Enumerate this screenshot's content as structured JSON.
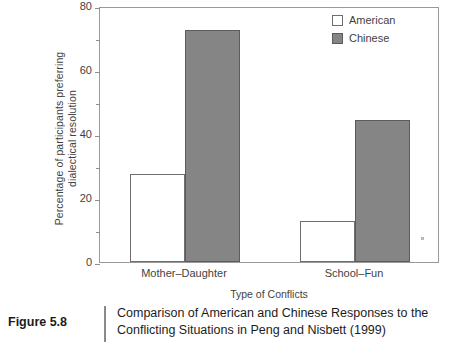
{
  "figure": {
    "number_label": "Figure 5.8",
    "caption_line1": "Comparison of American and Chinese Responses to the",
    "caption_line2": "Conflicting Situations in Peng and Nisbett (1999)"
  },
  "legend": {
    "position": "top-right",
    "entries": [
      {
        "label": "American",
        "swatch": "white-square",
        "color": "#ffffff"
      },
      {
        "label": "Chinese",
        "swatch": "gray-square",
        "color": "#858585"
      }
    ]
  },
  "axes": {
    "y_title_line1": "Percentage of participants preferring",
    "y_title_line2": "dialectical resolution",
    "x_title": "Type of Conflicts",
    "y_ticks": [
      "0",
      "20",
      "40",
      "60",
      "80"
    ],
    "y_minor_ticks": [
      "10",
      "30",
      "50",
      "70"
    ]
  },
  "chart_data": {
    "type": "bar",
    "title": "Comparison of American and Chinese Responses to the Conflicting Situations in Peng and Nisbett (1999)",
    "categories": [
      "Mother–Daughter",
      "School–Fun"
    ],
    "series": [
      {
        "name": "American",
        "values": [
          27.5,
          12.8
        ],
        "color": "#ffffff"
      },
      {
        "name": "Chinese",
        "values": [
          72.5,
          44.4
        ],
        "color": "#858585"
      }
    ],
    "xlabel": "Type of Conflicts",
    "ylabel": "Percentage of participants preferring dialectical resolution",
    "ylim": [
      0,
      80
    ],
    "ytick_values": [
      0,
      20,
      40,
      60,
      80
    ],
    "yminor_tick_values": [
      10,
      30,
      50,
      70
    ],
    "grid": false,
    "legend_position": "upper right"
  }
}
